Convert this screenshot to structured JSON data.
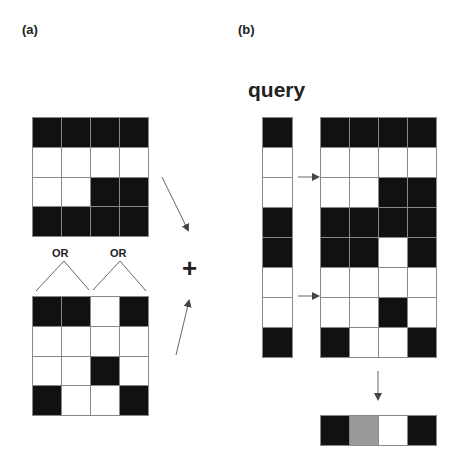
{
  "labels": {
    "panel_a": "(a)",
    "panel_b": "(b)",
    "query": "query",
    "or_left": "OR",
    "or_right": "OR",
    "plus": "+"
  },
  "colors": {
    "filled": "#111111",
    "empty": "#ffffff",
    "partial": "#999999",
    "grid_line": "#888888"
  },
  "panel_a": {
    "top_grid": [
      [
        1,
        1,
        1,
        1
      ],
      [
        0,
        0,
        0,
        0
      ],
      [
        0,
        0,
        1,
        1
      ],
      [
        1,
        1,
        1,
        1
      ]
    ],
    "bottom_grid": [
      [
        1,
        1,
        0,
        1
      ],
      [
        0,
        0,
        0,
        0
      ],
      [
        0,
        0,
        1,
        0
      ],
      [
        1,
        0,
        0,
        1
      ]
    ]
  },
  "panel_b": {
    "query_column": [
      1,
      0,
      0,
      1,
      1,
      0,
      0,
      1
    ],
    "combined_grid": [
      [
        1,
        1,
        1,
        1
      ],
      [
        0,
        0,
        0,
        0
      ],
      [
        0,
        0,
        1,
        1
      ],
      [
        1,
        1,
        1,
        1
      ],
      [
        1,
        1,
        0,
        1
      ],
      [
        0,
        0,
        0,
        0
      ],
      [
        0,
        0,
        1,
        0
      ],
      [
        1,
        0,
        0,
        1
      ]
    ],
    "result_row": [
      1,
      0.5,
      0,
      1
    ]
  }
}
